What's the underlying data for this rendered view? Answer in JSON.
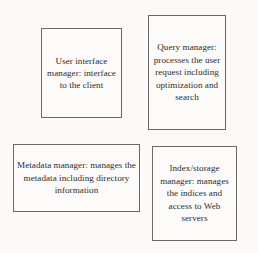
{
  "diagram": {
    "background_color": "#fbfaf8",
    "border_color": "#6b6967",
    "text_color": "#2e2c2b",
    "boxes": [
      {
        "id": "user-interface-manager",
        "name": "User interface manager",
        "text": "User interface manager: interface to the client",
        "position": "top-left"
      },
      {
        "id": "query-manager",
        "name": "Query manager",
        "text": "Query manager: processes the user request including optimization and search",
        "position": "top-right"
      },
      {
        "id": "metadata-manager",
        "name": "Metadata manager",
        "text": "Metadata manager: manages the metadata including directory information",
        "position": "bottom-left"
      },
      {
        "id": "index-storage-manager",
        "name": "Index/storage manager",
        "text": "Index/storage manager: manages the indices and access to Web servers",
        "position": "bottom-right"
      }
    ]
  }
}
